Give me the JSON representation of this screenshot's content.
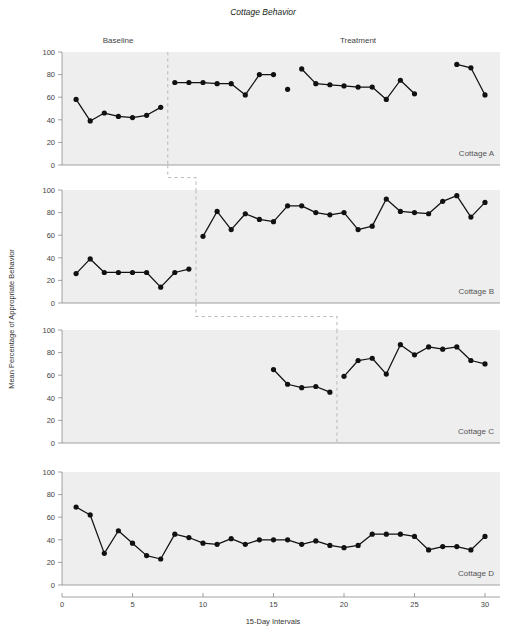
{
  "figure": {
    "title": "Cottage Behavior",
    "xlabel": "15-Day Intervals",
    "ylabel": "Mean Percentage of Appropriate Behavior",
    "phase_labels": {
      "baseline": "Baseline",
      "treatment": "Treatment"
    },
    "colors": {
      "plot_background": "#eeeeee",
      "marker": "#111111",
      "line": "#111111",
      "axis": "#8a8a8a",
      "phase_line": "#bdbdbd",
      "text": "#231f20"
    }
  },
  "chart_data": {
    "type": "line",
    "title": "Cottage Behavior",
    "xlabel": "15-Day Intervals",
    "ylabel": "Mean Percentage of Appropriate Behavior",
    "xlim": [
      0,
      31
    ],
    "ylim": [
      0,
      100
    ],
    "xticks": [
      0,
      5,
      10,
      15,
      20,
      25,
      30
    ],
    "yticks": [
      0,
      20,
      40,
      60,
      80,
      100
    ],
    "grid": false,
    "legend": "none",
    "design": "multiple-baseline across settings",
    "panels": [
      {
        "name": "Cottage A",
        "phase_change_x": 7.5,
        "baseline": {
          "label": "Baseline",
          "x": [
            1,
            2,
            3,
            4,
            5,
            6,
            7
          ],
          "y": [
            58,
            39,
            46,
            43,
            42,
            44,
            51
          ]
        },
        "treatment": {
          "label": "Treatment",
          "segments": [
            {
              "x": [
                8,
                9,
                10,
                11,
                12,
                13,
                14,
                15
              ],
              "y": [
                73,
                73,
                73,
                72,
                72,
                62,
                80,
                80
              ]
            },
            {
              "x": [
                16
              ],
              "y": [
                67
              ]
            },
            {
              "x": [
                17,
                18,
                19,
                20,
                21,
                22,
                23,
                24,
                25,
                26
              ],
              "y": [
                85,
                72,
                71,
                70,
                69,
                69,
                58,
                75,
                63
              ]
            },
            {
              "x": [
                28,
                29,
                30
              ],
              "y": [
                89,
                86,
                62
              ]
            }
          ]
        }
      },
      {
        "name": "Cottage B",
        "phase_change_x": 9.5,
        "baseline": {
          "x": [
            1,
            2,
            3,
            4,
            5,
            6,
            7,
            8,
            9
          ],
          "y": [
            26,
            39,
            27,
            27,
            27,
            27,
            14,
            27,
            30
          ]
        },
        "treatment": {
          "x": [
            10,
            11,
            12,
            13,
            14,
            15,
            16,
            17,
            18,
            19,
            20,
            21,
            22,
            23,
            24,
            25,
            26,
            27,
            28,
            29,
            30
          ],
          "y": [
            59,
            81,
            65,
            79,
            74,
            72,
            86,
            86,
            80,
            78,
            80,
            65,
            68,
            92,
            81,
            80,
            79,
            90,
            95,
            76,
            89
          ]
        }
      },
      {
        "name": "Cottage C",
        "phase_change_x": 19.5,
        "baseline": {
          "x": [
            15,
            16,
            17,
            18,
            19
          ],
          "y": [
            65,
            52,
            49,
            50,
            45
          ]
        },
        "treatment": {
          "x": [
            20,
            21,
            22,
            23,
            24,
            25,
            26,
            27,
            28,
            29,
            30
          ],
          "y": [
            59,
            73,
            75,
            61,
            87,
            78,
            85,
            83,
            85,
            73,
            70
          ]
        }
      },
      {
        "name": "Cottage D",
        "phase_change_x": null,
        "baseline": {
          "x": [
            1,
            2,
            3,
            4,
            5,
            6,
            7,
            8,
            9,
            10,
            11,
            12,
            13,
            14,
            15,
            16,
            17,
            18,
            19,
            20,
            21,
            22,
            23,
            24,
            25,
            26,
            27,
            28,
            29,
            30
          ],
          "y": [
            69,
            62,
            28,
            48,
            37,
            26,
            23,
            45,
            42,
            37,
            36,
            41,
            36,
            40,
            40,
            40,
            36,
            39,
            35,
            33,
            35,
            45,
            45,
            45,
            43,
            31,
            34,
            34,
            31,
            43
          ]
        }
      }
    ],
    "connector_steps": [
      {
        "from_panel": "Cottage A",
        "to_panel": "Cottage B",
        "x_from": 7.5,
        "x_to": 9.5
      },
      {
        "from_panel": "Cottage B",
        "to_panel": "Cottage C",
        "x_from": 9.5,
        "x_to": 19.5
      }
    ]
  }
}
